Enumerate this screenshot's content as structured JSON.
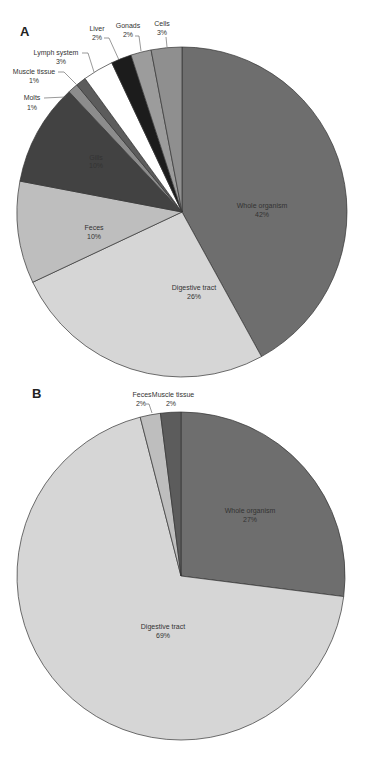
{
  "chart_data": [
    {
      "type": "pie",
      "panel": "A",
      "title": "",
      "start_angle": "12 o'clock, clockwise",
      "categories": [
        "Whole organism",
        "Digestive tract",
        "Feces",
        "Gills",
        "Molts",
        "Muscle tissue",
        "Lymph system",
        "Liver",
        "Gonads",
        "Cells"
      ],
      "values": [
        42,
        26,
        10,
        10,
        1,
        1,
        3,
        2,
        2,
        3
      ],
      "labels": [
        "Whole organism\n42%",
        "Digestive tract\n26%",
        "Feces\n10%",
        "Gills\n10%",
        "Molts\n1%",
        "Muscle tissue\n1%",
        "Lymph system\n3%",
        "Liver\n2%",
        "Gonads\n2%",
        "Cells\n3%"
      ],
      "colors": [
        "#6e6e6e",
        "#d6d6d6",
        "#bebebe",
        "#424242",
        "#8c8c8c",
        "#5c5c5c",
        "#ffffff",
        "#1c1c1c",
        "#9c9c9c",
        "#8f8f8f"
      ],
      "legend": "none (data labels)"
    },
    {
      "type": "pie",
      "panel": "B",
      "title": "",
      "start_angle": "12 o'clock, clockwise",
      "categories": [
        "Whole organism",
        "Digestive tract",
        "Feces",
        "Muscle tissue"
      ],
      "values": [
        27,
        69,
        2,
        2
      ],
      "labels": [
        "Whole organism\n27%",
        "Digestive tract\n69%",
        "Feces\n2%",
        "Muscle tissue\n2%"
      ],
      "colors": [
        "#6e6e6e",
        "#d6d6d6",
        "#bebebe",
        "#5c5c5c"
      ],
      "legend": "none (data labels)"
    }
  ],
  "panels": {
    "a_letter": "A",
    "b_letter": "B"
  },
  "labels_a": {
    "whole_name": "Whole organism",
    "whole_pct": "42%",
    "digest_name": "Digestive tract",
    "digest_pct": "26%",
    "feces_name": "Feces",
    "feces_pct": "10%",
    "gills_name": "Gills",
    "gills_pct": "10%",
    "molts_name": "Molts",
    "molts_pct": "1%",
    "muscle_name": "Muscle tissue",
    "muscle_pct": "1%",
    "lymph_name": "Lymph system",
    "lymph_pct": "3%",
    "liver_name": "Liver",
    "liver_pct": "2%",
    "gonads_name": "Gonads",
    "gonads_pct": "2%",
    "cells_name": "Cells",
    "cells_pct": "3%"
  },
  "labels_b": {
    "whole_name": "Whole organism",
    "whole_pct": "27%",
    "digest_name": "Digestive tract",
    "digest_pct": "69%",
    "feces_name": "Feces",
    "feces_pct": "2%",
    "muscle_name": "Muscle tissue",
    "muscle_pct": "2%"
  }
}
